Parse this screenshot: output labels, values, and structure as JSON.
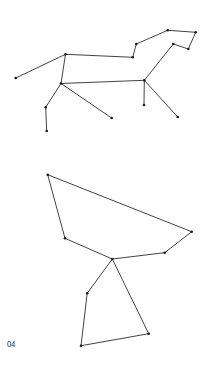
{
  "figure_label": "04",
  "style": {
    "line_color": "#2e2e2e",
    "node_color": "#1a1a1a",
    "background": "#ffffff"
  },
  "figures": [
    {
      "name": "horse-constellation",
      "nodes": {
        "A": [
          15.7,
          78
        ],
        "B": [
          65.5,
          54.3
        ],
        "C": [
          132.7,
          57.3
        ],
        "D": [
          136.3,
          44
        ],
        "E": [
          167.7,
          30.3
        ],
        "F": [
          195.7,
          32.3
        ],
        "G": [
          188.3,
          49
        ],
        "H": [
          173.3,
          44
        ],
        "I": [
          144.3,
          80.3
        ],
        "J": [
          61,
          83.5
        ],
        "K": [
          45.7,
          107.3
        ],
        "L": [
          46.7,
          131
        ],
        "M": [
          111.7,
          118
        ],
        "N": [
          144,
          105
        ],
        "O": [
          177.7,
          117
        ]
      },
      "edges": [
        [
          "A",
          "B"
        ],
        [
          "B",
          "C"
        ],
        [
          "C",
          "D"
        ],
        [
          "D",
          "E"
        ],
        [
          "E",
          "F"
        ],
        [
          "F",
          "G"
        ],
        [
          "G",
          "H"
        ],
        [
          "H",
          "I"
        ],
        [
          "I",
          "J"
        ],
        [
          "B",
          "J"
        ],
        [
          "J",
          "K"
        ],
        [
          "K",
          "L"
        ],
        [
          "J",
          "M"
        ],
        [
          "I",
          "N"
        ],
        [
          "I",
          "O"
        ]
      ]
    },
    {
      "name": "cup-constellation",
      "nodes": {
        "P": [
          47.7,
          174.7
        ],
        "Q": [
          191.7,
          231.7
        ],
        "R": [
          164.7,
          252.7
        ],
        "S": [
          112.3,
          259
        ],
        "T": [
          65,
          238.3
        ],
        "U": [
          87.2,
          293.3
        ],
        "V": [
          81,
          345.7
        ],
        "W": [
          148.7,
          333.7
        ]
      },
      "edges": [
        [
          "P",
          "Q"
        ],
        [
          "Q",
          "R"
        ],
        [
          "R",
          "S"
        ],
        [
          "S",
          "T"
        ],
        [
          "T",
          "P"
        ],
        [
          "S",
          "U"
        ],
        [
          "U",
          "V"
        ],
        [
          "V",
          "W"
        ],
        [
          "W",
          "S"
        ]
      ]
    }
  ]
}
